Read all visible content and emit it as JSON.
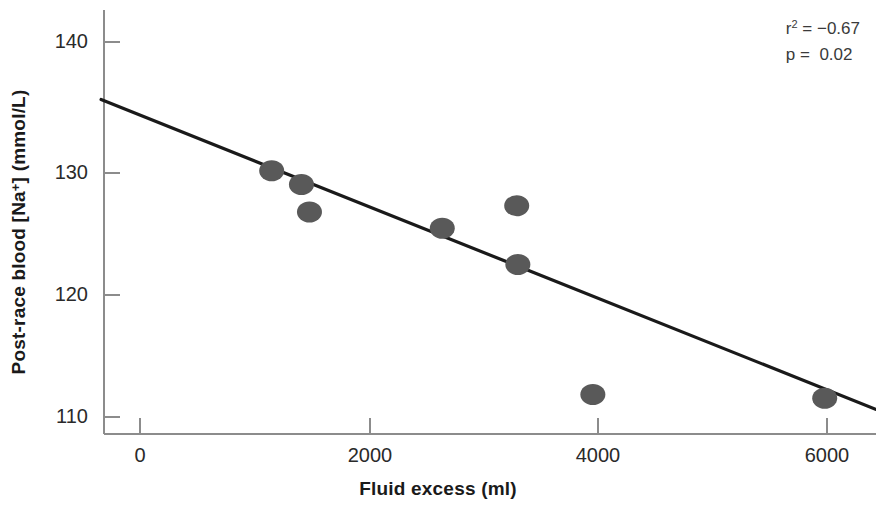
{
  "chart_data": {
    "type": "scatter",
    "title": "",
    "xlabel": "Fluid excess (ml)",
    "ylabel": "Post-race blood [Na+] (mmol/L)",
    "ylabel_prefix": "Post-race blood [Na",
    "ylabel_sup": "+",
    "ylabel_suffix": "] (mmol/L)",
    "xlim": [
      -350,
      6450
    ],
    "ylim": [
      108.6,
      141.5
    ],
    "grid": false,
    "legend": null,
    "xticks": [
      0,
      2000,
      4000,
      6000
    ],
    "xtick_labels": [
      "0",
      "2000",
      "4000",
      "6000"
    ],
    "yticks": [
      110,
      120,
      130,
      140
    ],
    "ytick_labels": [
      "110",
      "120",
      "130",
      "140"
    ],
    "marker_color": "#595959",
    "line_color": "#1a1a1a",
    "axis_color": "#8c8c8c",
    "points": [
      {
        "x": 1150,
        "y": 129.7
      },
      {
        "x": 1410,
        "y": 128.6
      },
      {
        "x": 1480,
        "y": 126.4
      },
      {
        "x": 2640,
        "y": 125.1
      },
      {
        "x": 3290,
        "y": 126.9
      },
      {
        "x": 3300,
        "y": 122.2
      },
      {
        "x": 3955,
        "y": 111.8
      },
      {
        "x": 5980,
        "y": 111.5
      }
    ],
    "series": [
      {
        "name": "Post-race blood sodium vs fluid excess",
        "x": [
          1150,
          1410,
          1480,
          2640,
          3290,
          3300,
          3955,
          5980
        ],
        "values": [
          129.7,
          128.6,
          126.4,
          125.1,
          126.9,
          122.2,
          111.8,
          111.5
        ]
      }
    ],
    "regression_line": {
      "x_start": -340,
      "y_start": 135.4,
      "x_end": 6430,
      "y_end": 110.6
    },
    "annotations": {
      "r_squared_label": "r",
      "r_squared_sup": "2",
      "r_squared_eq": " = ",
      "r_squared_value": "−0.67",
      "p_label": "p",
      "p_eq": " =  ",
      "p_value": "0.02",
      "r_squared_line": "r2 = −0.67",
      "p_line": "p =   0.02"
    }
  }
}
